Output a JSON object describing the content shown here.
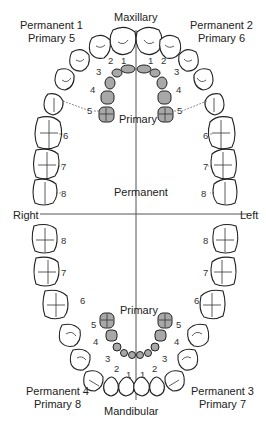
{
  "diagram": {
    "title_top": "Maxillary",
    "title_bottom": "Mandibular",
    "center_primary_top": "Primary",
    "center_primary_bottom": "Primary",
    "center_permanent": "Permanent",
    "side_right": "Right",
    "side_left": "Left",
    "quadrants": [
      {
        "id": "upper-right",
        "line1": "Permanent 1",
        "line2": "Primary 5"
      },
      {
        "id": "upper-left",
        "line1": "Permanent 2",
        "line2": "Primary 6"
      },
      {
        "id": "lower-left",
        "line1": "Permanent 3",
        "line2": "Primary 7"
      },
      {
        "id": "lower-right",
        "line1": "Permanent 4",
        "line2": "Primary 8"
      }
    ],
    "permanent_tooth_numbers": [
      "1",
      "2",
      "3",
      "4",
      "5",
      "6",
      "7",
      "8"
    ],
    "primary_tooth_numbers": [
      "1",
      "2",
      "3",
      "4",
      "5"
    ],
    "colors": {
      "primary_teeth": "#a8a8a8",
      "permanent_teeth": "#ffffff",
      "outline": "#222222",
      "axis": "#555555"
    }
  }
}
